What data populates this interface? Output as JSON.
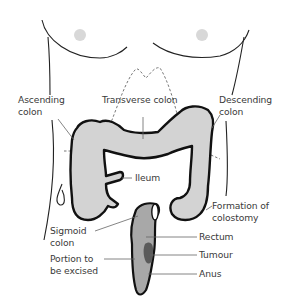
{
  "diagram": {
    "colors": {
      "outline": "#111111",
      "colon_fill": "#d3d3d3",
      "rectum_fill": "#a8a8a8",
      "tumour_fill": "#5a5a5a",
      "nipple_fill": "#d8d8d8",
      "leader_line": "#777777",
      "label_text": "#3a3a3a"
    },
    "labels": {
      "ascending_colon": "Ascending\ncolon",
      "transverse_colon": "Transverse colon",
      "descending_colon": "Descending\ncolon",
      "ileum": "Ileum",
      "formation_of_colostomy": "Formation of\ncolostomy",
      "sigmoid_colon": "Sigmoid\ncolon",
      "rectum": "Rectum",
      "portion_to_be_excised": "Portion to\nbe excised",
      "tumour": "Tumour",
      "anus": "Anus"
    }
  }
}
